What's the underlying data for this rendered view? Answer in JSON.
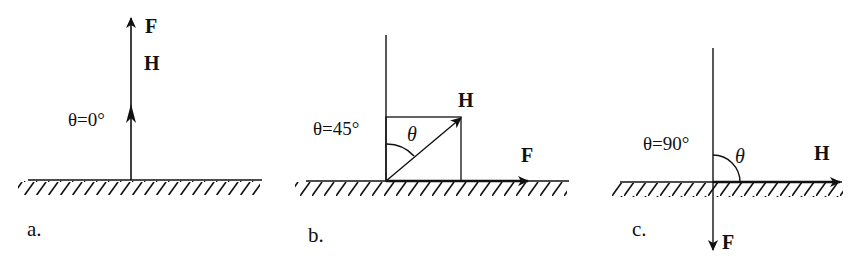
{
  "figure": {
    "panels": [
      {
        "id": "a",
        "caption": "a.",
        "angle_label": "θ=0°",
        "vectors": [
          {
            "name": "F",
            "direction": "up"
          },
          {
            "name": "H",
            "direction": "up"
          }
        ],
        "labels": {
          "F": "F",
          "H": "H"
        }
      },
      {
        "id": "b",
        "caption": "b.",
        "angle_label": "θ=45°",
        "theta_symbol": "θ",
        "vectors": [
          {
            "name": "H",
            "direction": "45° from vertical"
          },
          {
            "name": "F",
            "direction": "right (horizontal)"
          }
        ],
        "labels": {
          "F": "F",
          "H": "H"
        }
      },
      {
        "id": "c",
        "caption": "c.",
        "angle_label": "θ=90°",
        "theta_symbol": "θ",
        "vectors": [
          {
            "name": "H",
            "direction": "right (horizontal)"
          },
          {
            "name": "F",
            "direction": "down"
          }
        ],
        "labels": {
          "F": "F",
          "H": "H"
        }
      }
    ],
    "colors": {
      "ink": "#111111",
      "background": "#ffffff"
    }
  }
}
